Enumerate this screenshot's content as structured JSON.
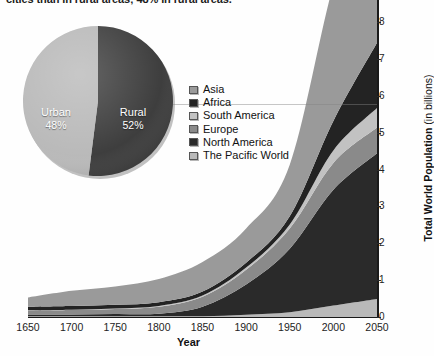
{
  "header": {
    "cropped_caption": "cities than in rural areas; 48% in rural areas."
  },
  "chart_data": {
    "type": "area",
    "title": "",
    "xlabel": "Year",
    "ylabel_bold": "Total World Population",
    "ylabel_rest": " (in billions)",
    "x": [
      1650,
      1700,
      1750,
      1800,
      1850,
      1900,
      1950,
      2000,
      2050
    ],
    "xlim": [
      1650,
      2050
    ],
    "ylim": [
      0,
      8.6
    ],
    "xticks": [
      "1650",
      "1700",
      "1750",
      "1800",
      "1850",
      "1900",
      "1950",
      "2000",
      "2050"
    ],
    "yticks": [
      "0",
      "1",
      "2",
      "3",
      "4",
      "5",
      "6",
      "7",
      "8"
    ],
    "grid": "single gridline at 6 billion",
    "legend_position": "inside-upper-left",
    "stacked": true,
    "series": [
      {
        "name": "The Pacific World",
        "color": "#b9b9b9",
        "values": [
          0.02,
          0.02,
          0.02,
          0.02,
          0.02,
          0.06,
          0.13,
          0.31,
          0.49
        ]
      },
      {
        "name": "North America",
        "color": "#2a2a2a",
        "values": [
          0.05,
          0.05,
          0.06,
          0.07,
          0.26,
          0.82,
          1.72,
          3.14,
          3.95
        ]
      },
      {
        "name": "Europe",
        "color": "#8a8a8a",
        "values": [
          0.1,
          0.12,
          0.14,
          0.19,
          0.27,
          0.4,
          0.55,
          0.73,
          0.7
        ]
      },
      {
        "name": "South America",
        "color": "#c2c2c2",
        "values": [
          0.01,
          0.01,
          0.01,
          0.02,
          0.03,
          0.06,
          0.11,
          0.34,
          0.53
        ]
      },
      {
        "name": "Africa",
        "color": "#232323",
        "values": [
          0.1,
          0.1,
          0.1,
          0.1,
          0.11,
          0.13,
          0.22,
          0.8,
          1.77
        ]
      },
      {
        "name": "Asia",
        "color": "#9a9a9a",
        "values": [
          0.25,
          0.41,
          0.5,
          0.63,
          0.8,
          0.93,
          1.4,
          3.7,
          5.3
        ]
      }
    ],
    "totals": [
      0.53,
      0.71,
      0.83,
      1.03,
      1.49,
      2.4,
      4.13,
      9.02,
      12.74
    ]
  },
  "pie_chart": {
    "type": "pie",
    "slices": [
      {
        "label": "Urban",
        "value": 48,
        "display": "48%",
        "color": "#b8b8b8"
      },
      {
        "label": "Rural",
        "value": 52,
        "display": "52%",
        "color": "#3a3a3a"
      }
    ]
  },
  "colors": {
    "axis": "#1a1a1a",
    "tick_text": "#232323",
    "background": "#fefefe"
  }
}
